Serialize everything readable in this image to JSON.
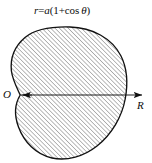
{
  "figure": {
    "type": "polar-curve-diagram",
    "curve_name": "cardioid",
    "equation_label": {
      "text": "r=a(1+cos θ)",
      "parts": {
        "r": "r",
        "equals": "=",
        "a": "a",
        "open_paren": "(",
        "one_plus": "1+cos ",
        "theta": "θ",
        "close_paren": ")"
      }
    },
    "origin_label": "O",
    "axis_label": "R",
    "colors": {
      "outline": "#111111",
      "hatch": "#6e6e6e",
      "axis": "#111111",
      "background": "#ffffff",
      "text": "#0d0d0d"
    },
    "geometry": {
      "cusp": {
        "x": 20,
        "y": 95
      },
      "right_extent_x": 126,
      "top_extent_y": 27,
      "bottom_extent_y": 160,
      "left_bulge_x": 11,
      "axis_start_x": 20,
      "axis_end_x": 150,
      "axis_y": 95,
      "hatch_angle_deg": 45,
      "hatch_spacing_px": 3
    }
  }
}
